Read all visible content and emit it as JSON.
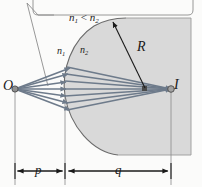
{
  "figure": {
    "labels": {
      "object_point": "O",
      "image_point": "I",
      "radius": "R",
      "object_distance": "p",
      "image_distance": "q",
      "index_medium_1": "n",
      "index_medium_1_sub": "1",
      "index_medium_2": "n",
      "index_medium_2_sub": "2",
      "inequality_n1": "n",
      "inequality_n1_sub": "1",
      "inequality_op": " < ",
      "inequality_n2": "n",
      "inequality_n2_sub": "2"
    },
    "colors": {
      "ray": "#6e7b8b",
      "medium_fill": "#d9d9d9",
      "outline": "#6b6b6b",
      "text": "#1a1a1a",
      "background": "#fbfbfa",
      "callout_stroke": "#8c8c8c",
      "dimension": "#1a1a1a"
    },
    "geometry": {
      "object_x": 15,
      "object_y": 89,
      "image_x": 171,
      "image_y": 89,
      "center_of_curvature_x": 145,
      "center_of_curvature_y": 88,
      "vertex_x": 65,
      "axis_y": 89,
      "dimension_line_y": 171
    }
  }
}
